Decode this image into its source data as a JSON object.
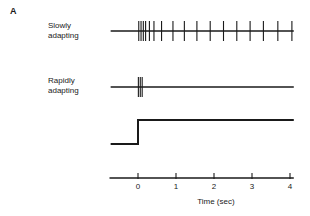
{
  "figure": {
    "panel_label": "A",
    "row_labels": {
      "slowly_adapting": "Slowly\nadapting",
      "rapidly_adapting": "Rapidly\nadapting"
    },
    "axis_title": "Time (sec)",
    "tick_labels": [
      "0",
      "1",
      "2",
      "3",
      "4"
    ],
    "colors": {
      "ink": "#1a1a1a",
      "background": "#ffffff"
    }
  },
  "chart_data": {
    "type": "line",
    "title": "",
    "subtitle": "",
    "xlabel": "Time (sec)",
    "ylabel": "",
    "xlim": [
      -0.75,
      4.1
    ],
    "xticks": [
      0,
      1,
      2,
      3,
      4
    ],
    "xticklabels": [
      "0",
      "1",
      "2",
      "3",
      "4"
    ],
    "grid": false,
    "legend": null,
    "annotations": [
      {
        "text": "A",
        "role": "panel-label"
      },
      {
        "text": "Slowly adapting",
        "role": "trace-label",
        "series": "slowly_adapting"
      },
      {
        "text": "Rapidly adapting",
        "role": "trace-label",
        "series": "rapidly_adapting"
      }
    ],
    "series": [
      {
        "name": "slowly_adapting",
        "type": "spike_train",
        "description": "Sustained firing: dense onset burst followed by regular tonic spikes for the duration of the stimulus",
        "spike_times": [
          0.02,
          0.08,
          0.14,
          0.2,
          0.3,
          0.42,
          0.62,
          0.92,
          1.22,
          1.55,
          1.9,
          2.25,
          2.6,
          2.95,
          3.3,
          3.68,
          4.05
        ],
        "baseline_start": -0.72,
        "baseline_end": 4.1,
        "spike_height_up": 10,
        "spike_height_down": 10
      },
      {
        "name": "rapidly_adapting",
        "type": "spike_train",
        "description": "Transient firing: brief burst at stimulus onset only, then silence",
        "spike_times": [
          0.01,
          0.06,
          0.11
        ],
        "baseline_start": -0.72,
        "baseline_end": 4.1,
        "spike_height_up": 10,
        "spike_height_down": 10
      },
      {
        "name": "stimulus",
        "type": "step",
        "description": "Step stimulus: onset at time zero, held for the remainder of the trace",
        "x": [
          -0.72,
          0.0,
          0.0,
          4.1
        ],
        "y": [
          0,
          0,
          1,
          1
        ],
        "low_level": 0,
        "high_level": 1
      }
    ]
  }
}
